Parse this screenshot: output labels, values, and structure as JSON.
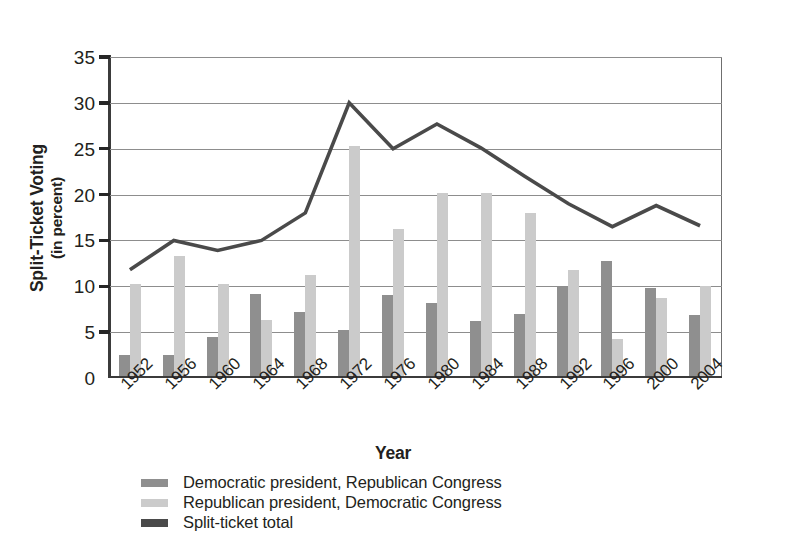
{
  "chart_data": {
    "type": "bar",
    "title": "",
    "xlabel": "Year",
    "ylabel": "Split-Ticket Voting (in percent)",
    "ylabel_line1": "Split-Ticket Voting",
    "ylabel_line2": "(in percent)",
    "categories": [
      "1952",
      "1956",
      "1960",
      "1964",
      "1968",
      "1972",
      "1976",
      "1980",
      "1984",
      "1988",
      "1992",
      "1996",
      "2000",
      "2004"
    ],
    "ylim": [
      0,
      35
    ],
    "yticks": [
      0,
      5,
      10,
      15,
      20,
      25,
      30,
      35
    ],
    "grid": true,
    "legend_position": "bottom-left",
    "series": [
      {
        "name": "Democratic president, Republican Congress",
        "type": "bar",
        "color": "#8f8f8f",
        "values": [
          2.2,
          2.2,
          4.2,
          8.9,
          6.9,
          5.0,
          8.8,
          7.9,
          5.9,
          6.7,
          9.7,
          12.5,
          9.5,
          6.6
        ]
      },
      {
        "name": "Republican president, Democratic Congress",
        "type": "bar",
        "color": "#cbcbcb",
        "values": [
          10.0,
          13.0,
          10.0,
          6.0,
          11.0,
          25.0,
          16.0,
          19.9,
          19.9,
          17.7,
          11.5,
          4.0,
          8.5,
          9.8
        ]
      },
      {
        "name": "Split-ticket total",
        "type": "line",
        "color": "#4a4a4a",
        "values": [
          11.8,
          15.0,
          13.9,
          15.0,
          18.0,
          30.0,
          25.0,
          27.7,
          25.1,
          22.0,
          19.0,
          16.5,
          18.8,
          16.6
        ]
      }
    ]
  },
  "axes": {
    "ytick_labels": [
      "0",
      "5",
      "10",
      "15",
      "20",
      "25",
      "30",
      "35"
    ],
    "xtitle": "Year"
  },
  "legend": {
    "items": [
      {
        "label": "Democratic president, Republican Congress",
        "color": "#8f8f8f"
      },
      {
        "label": "Republican president, Democratic Congress",
        "color": "#cbcbcb"
      },
      {
        "label": "Split-ticket total",
        "color": "#4a4a4a"
      }
    ]
  }
}
